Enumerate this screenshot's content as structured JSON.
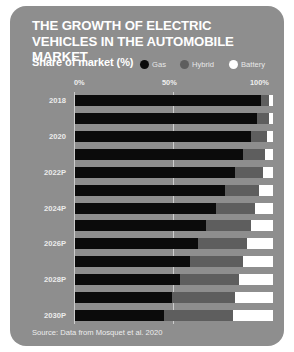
{
  "card": {
    "background": "#8e8e8e"
  },
  "title": "The growth of electric vehicles in the automobile market",
  "subtitle": "Share of market (%)",
  "source": "Source: Data from Mosquet et al. 2020",
  "legend": [
    {
      "label": "Gas",
      "color": "#0b0b0b",
      "name": "gas"
    },
    {
      "label": "Hybrid",
      "color": "#5e5e5e",
      "name": "hybrid"
    },
    {
      "label": "Battery",
      "color": "#ffffff",
      "name": "battery"
    }
  ],
  "axis": {
    "ticks": [
      "0%",
      "50%",
      "100%"
    ]
  },
  "chart_data": {
    "type": "bar",
    "orientation": "horizontal",
    "stacked": true,
    "stack_total": 100,
    "title": "The growth of electric vehicles in the automobile market",
    "subtitle": "Share of market (%)",
    "xlabel": "Share of market (%)",
    "ylabel": "",
    "xlim": [
      0,
      100
    ],
    "xticks": [
      0,
      50,
      100
    ],
    "xtick_labels": [
      "0%",
      "50%",
      "100%"
    ],
    "grid": true,
    "legend_position": "top",
    "source": "Source: Data from Mosquet et al. 2020",
    "categories": [
      "2018",
      "2019",
      "2020",
      "2021",
      "2022P",
      "2023P",
      "2024P",
      "2025P",
      "2026P",
      "2027P",
      "2028P",
      "2029P",
      "2030P"
    ],
    "visible_category_labels": [
      "2018",
      "",
      "2020",
      "",
      "2022P",
      "",
      "2024P",
      "",
      "2026P",
      "",
      "2028P",
      "",
      "2030P"
    ],
    "series": [
      {
        "name": "Gas",
        "color": "#0b0b0b",
        "values": [
          94,
          92,
          89,
          85,
          81,
          76,
          71,
          66,
          62,
          58,
          53,
          49,
          45
        ]
      },
      {
        "name": "Hybrid",
        "color": "#5e5e5e",
        "values": [
          4,
          6,
          8,
          11,
          14,
          17,
          20,
          23,
          25,
          27,
          30,
          32,
          35
        ]
      },
      {
        "name": "Battery",
        "color": "#ffffff",
        "values": [
          2,
          2,
          3,
          4,
          5,
          7,
          9,
          11,
          13,
          15,
          17,
          19,
          20
        ]
      }
    ]
  }
}
